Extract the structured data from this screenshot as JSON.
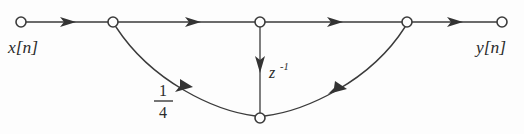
{
  "figure": {
    "type": "signal-flow-graph",
    "background_color": "#fdfdfd",
    "line_color": "#3b3b3b",
    "text_color": "#2b2b2b"
  },
  "labels": {
    "input": "x[n]",
    "output": "y[n]",
    "delay": "z",
    "delay_exponent": "-1",
    "gain_numerator": "1",
    "gain_denominator": "4"
  },
  "nodes": [
    {
      "id": "input-node",
      "name": "input-node",
      "x": 21,
      "y": 22,
      "r": 5
    },
    {
      "id": "branch-node",
      "name": "branch-node",
      "x": 113,
      "y": 22,
      "r": 5
    },
    {
      "id": "center-node",
      "name": "center-node",
      "x": 260,
      "y": 22,
      "r": 5
    },
    {
      "id": "sum-node",
      "name": "sum-node",
      "x": 407,
      "y": 22,
      "r": 5
    },
    {
      "id": "output-node",
      "name": "output-node",
      "x": 502,
      "y": 22,
      "r": 5
    },
    {
      "id": "feedback-node",
      "name": "feedback-node",
      "x": 260,
      "y": 118,
      "r": 5
    }
  ],
  "edges": [
    {
      "id": "edge-input-branch",
      "from": "input-node",
      "to": "branch-node",
      "arrow_at": 0.52
    },
    {
      "id": "edge-branch-center",
      "from": "branch-node",
      "to": "center-node",
      "arrow_at": 0.52
    },
    {
      "id": "edge-center-sum",
      "from": "center-node",
      "to": "sum-node",
      "arrow_at": 0.52
    },
    {
      "id": "edge-sum-output",
      "from": "sum-node",
      "to": "output-node",
      "arrow_at": 0.55
    },
    {
      "id": "edge-delay",
      "from": "center-node",
      "to": "feedback-node",
      "arrow_at": 0.5,
      "label": "z^-1"
    },
    {
      "id": "edge-feedback-left",
      "from": "feedback-node",
      "to": "branch-node",
      "arrow_at": 0.55,
      "label": "1/4"
    },
    {
      "id": "edge-feedback-right",
      "from": "feedback-node",
      "to": "sum-node",
      "arrow_at": 0.58
    }
  ]
}
